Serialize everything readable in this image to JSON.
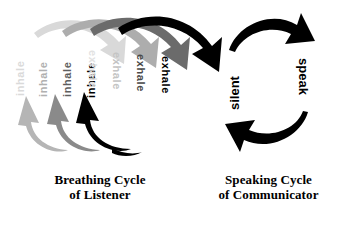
{
  "figure": {
    "background_color": "#ffffff",
    "panels": [
      {
        "id": "breathing",
        "caption_line1": "Breathing Cycle",
        "caption_line2": "of Listener",
        "cycle_phases": [
          "inhale",
          "exhale"
        ],
        "repetitions": 4,
        "inhale_labels": [
          "inhale",
          "inhale",
          "inhale",
          "inhale"
        ],
        "exhale_labels": [
          "exhale",
          "exhale",
          "exhale",
          "exhale"
        ],
        "shade_sequence": [
          "#d6d6d6",
          "#a8a8a8",
          "#6e6e6e",
          "#000000"
        ],
        "shade_names": [
          "lightest-gray",
          "light-gray",
          "dark-gray",
          "black"
        ],
        "top_arrow_direction": "left-to-right-descending",
        "bottom_arrow_direction": "right-to-left-ascending"
      },
      {
        "id": "speaking",
        "caption_line1": "Speaking Cycle",
        "caption_line2": "of Communicator",
        "cycle_phases": [
          "silent",
          "speak"
        ],
        "left_label": "silent",
        "right_label": "speak",
        "arrow_color": "#000000",
        "top_arrow_direction": "left-to-right-descending",
        "bottom_arrow_direction": "right-to-left-ascending"
      }
    ]
  }
}
